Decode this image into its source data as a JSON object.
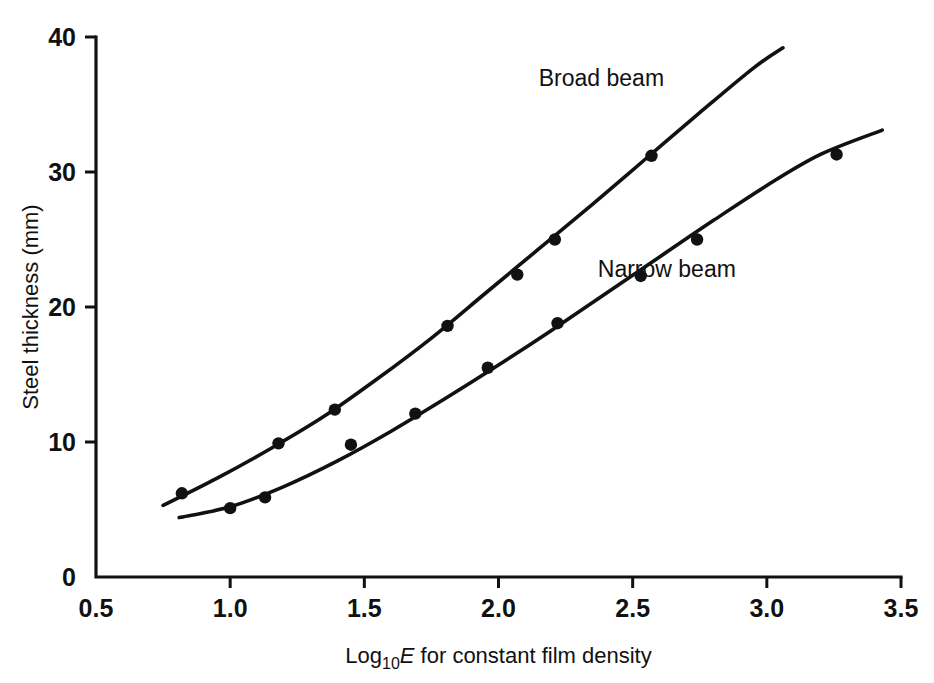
{
  "chart_data": {
    "type": "scatter",
    "title": "",
    "xlabel": "Log10E for constant film density",
    "xlabel_parts": {
      "prefix": "Log",
      "subscript": "10",
      "italic": "E",
      "suffix": " for constant film density"
    },
    "ylabel": "Steel thickness (mm)",
    "xlim": [
      0.5,
      3.5
    ],
    "ylim": [
      0,
      40
    ],
    "xticks": [
      0.5,
      1.0,
      1.5,
      2.0,
      2.5,
      3.0,
      3.5
    ],
    "xticklabels": [
      "0.5",
      "1.0",
      "1.5",
      "2.0",
      "2.5",
      "3.0",
      "3.5"
    ],
    "yticks": [
      0,
      10,
      20,
      30,
      40
    ],
    "yticklabels": [
      "0",
      "10",
      "20",
      "30",
      "40"
    ],
    "grid": false,
    "legend_position": "inline-annotations",
    "series": [
      {
        "name": "Broad beam",
        "label_x": 2.15,
        "label_y": 36.4,
        "marker": "filled-circle",
        "color": "#111111",
        "x": [
          0.82,
          1.18,
          1.39,
          1.81,
          2.07,
          2.21,
          2.57
        ],
        "y": [
          6.2,
          9.9,
          12.4,
          18.6,
          22.4,
          25.0,
          31.2
        ],
        "curve_x": [
          0.75,
          0.95,
          1.15,
          1.35,
          1.55,
          1.75,
          1.95,
          2.15,
          2.35,
          2.55,
          2.75,
          2.95,
          3.06
        ],
        "curve_y": [
          5.3,
          7.3,
          9.5,
          11.9,
          14.7,
          17.7,
          21.0,
          24.3,
          27.6,
          31.0,
          34.4,
          37.7,
          39.2
        ]
      },
      {
        "name": "Narrow beam",
        "label_x": 2.37,
        "label_y": 22.2,
        "marker": "filled-circle",
        "color": "#111111",
        "x": [
          1.0,
          1.13,
          1.45,
          1.69,
          1.96,
          2.22,
          2.53,
          2.74,
          3.26
        ],
        "y": [
          5.1,
          5.9,
          9.8,
          12.1,
          15.5,
          18.8,
          22.3,
          25.0,
          31.3
        ],
        "curve_x": [
          0.81,
          1.0,
          1.2,
          1.4,
          1.6,
          1.8,
          2.0,
          2.2,
          2.4,
          2.6,
          2.8,
          3.0,
          3.2,
          3.43
        ],
        "curve_y": [
          4.4,
          5.2,
          6.7,
          8.6,
          10.8,
          13.2,
          15.7,
          18.3,
          21.0,
          23.7,
          26.4,
          29.0,
          31.3,
          33.1
        ]
      }
    ]
  },
  "colors": {
    "ink": "#111111",
    "background": "#ffffff"
  }
}
